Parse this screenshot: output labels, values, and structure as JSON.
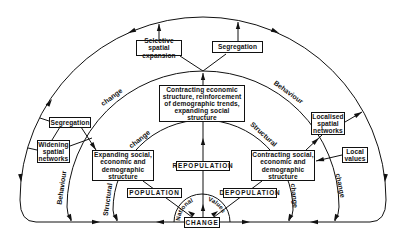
{
  "diagram": {
    "boxes": {
      "selective_spatial_expansion": "Selective spatial\nexpansion",
      "segregation_top": "Segregation",
      "contracting_economic": "Contracting economic\nstructure, reinforcement\nof demographic trends,\nexpanding social\nstructure",
      "segregation_left": "Segregation",
      "widening_spatial_networks": "Widening\nspatial\nnetworks",
      "expanding_social": "Expanding social,\neconomic and\ndemographic\nstructure",
      "localised_spatial_networks": "Localised\nspatial\nnetworks",
      "local_values": "Local\nvalues",
      "contracting_social": "Contracting social,\neconomic and\ndemographic\nstructure",
      "population": "POPULATION",
      "repopulation": "REPOPULATION",
      "depopulation": "DEPOPULATION",
      "change": "CHANGE"
    },
    "arc_labels": {
      "outer_left_change": "change",
      "outer_right_behaviour": "Behaviour",
      "inner_left_change": "change",
      "inner_right_structural": "Structural",
      "lower_left_behaviour": "Behaviour",
      "lower_left_structural": "Structural",
      "lower_right_change_inner": "change",
      "lower_right_change_outer": "change"
    },
    "national_values": {
      "left": "National",
      "right": "Values"
    },
    "colors": {
      "line": "#111111",
      "background": "#ffffff"
    }
  }
}
